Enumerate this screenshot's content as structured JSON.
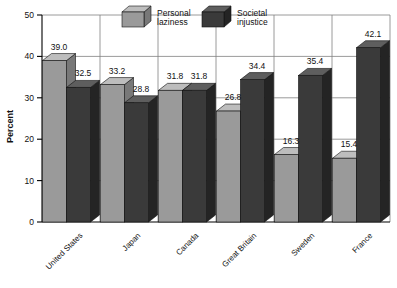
{
  "chart_data": {
    "type": "bar",
    "title": "",
    "subtitle": "",
    "xlabel": "",
    "ylabel": "Percent",
    "ylim": [
      0,
      50
    ],
    "yticks": [
      0,
      10,
      20,
      30,
      40,
      50
    ],
    "ytick_labels": [
      "0",
      "10",
      "20",
      "30",
      "40",
      "50"
    ],
    "grid": "horizontal-and-vertical",
    "legend_position": "top-center",
    "three_d": true,
    "categories": [
      "United States",
      "Japan",
      "Canada",
      "Great Britain",
      "Sweden",
      "France"
    ],
    "series": [
      {
        "name": "Personal laziness",
        "color": "#9a9a9a",
        "top_color": "#bdbdbd",
        "side_color": "#787878",
        "values": [
          39.0,
          33.2,
          31.8,
          26.8,
          16.3,
          15.4
        ],
        "labels": [
          "39.0",
          "33.2",
          "31.8",
          "26.8",
          "16.3",
          "15.4"
        ]
      },
      {
        "name": "Societal injustice",
        "color": "#3a3a3a",
        "top_color": "#5e5e5e",
        "side_color": "#242424",
        "values": [
          32.5,
          28.8,
          31.8,
          34.4,
          35.4,
          42.1
        ],
        "labels": [
          "32.5",
          "28.8",
          "31.8",
          "34.4",
          "35.4",
          "42.1"
        ]
      }
    ]
  },
  "legend": {
    "items": [
      {
        "line1": "Personal",
        "line2": "laziness",
        "swatch": "light-cube-icon"
      },
      {
        "line1": "Societal",
        "line2": "injustice",
        "swatch": "dark-cube-icon"
      }
    ]
  },
  "axes": {
    "y_title": "Percent"
  },
  "colors": {
    "background": "#ffffff",
    "axis": "#000000",
    "grid": "#808080",
    "light_bar_front": "#9a9a9a",
    "light_bar_top": "#bdbdbd",
    "light_bar_side": "#787878",
    "dark_bar_front": "#3a3a3a",
    "dark_bar_top": "#5e5e5e",
    "dark_bar_side": "#242424",
    "text": "#111111"
  }
}
